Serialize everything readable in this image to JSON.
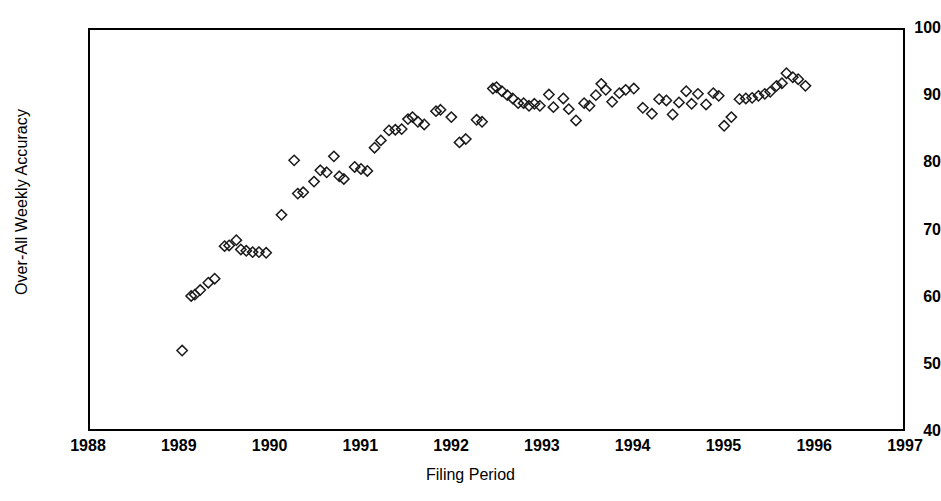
{
  "chart_data": {
    "type": "scatter",
    "title": "",
    "xlabel": "Filing Period",
    "ylabel": "Over-All Weekly Accuracy",
    "xlim": [
      1988,
      1997
    ],
    "ylim": [
      40,
      100
    ],
    "xticks": [
      1988,
      1989,
      1990,
      1991,
      1992,
      1993,
      1994,
      1995,
      1996,
      1997
    ],
    "yticks": [
      40,
      50,
      60,
      70,
      80,
      90,
      100
    ],
    "xtick_labels": [
      "1988",
      "1989",
      "1990",
      "1991",
      "1992",
      "1993",
      "1994",
      "1995",
      "1996",
      "1997"
    ],
    "ytick_labels": [
      "40",
      "50",
      "60",
      "70",
      "80",
      "90",
      "100"
    ],
    "grid": false,
    "legend": null,
    "marker": "open-diamond",
    "marker_color": "#1a1a1a",
    "series": [
      {
        "name": "Over-All Weekly Accuracy",
        "points": [
          [
            1989.02,
            51.8
          ],
          [
            1989.12,
            60.0
          ],
          [
            1989.16,
            60.2
          ],
          [
            1989.22,
            60.9
          ],
          [
            1989.31,
            62.0
          ],
          [
            1989.38,
            62.6
          ],
          [
            1989.49,
            67.5
          ],
          [
            1989.54,
            67.6
          ],
          [
            1989.62,
            68.4
          ],
          [
            1989.67,
            67.0
          ],
          [
            1989.73,
            66.8
          ],
          [
            1989.8,
            66.6
          ],
          [
            1989.87,
            66.6
          ],
          [
            1989.95,
            66.5
          ],
          [
            1990.12,
            72.2
          ],
          [
            1990.26,
            80.4
          ],
          [
            1990.3,
            75.4
          ],
          [
            1990.36,
            75.6
          ],
          [
            1990.48,
            77.2
          ],
          [
            1990.55,
            78.9
          ],
          [
            1990.62,
            78.6
          ],
          [
            1990.7,
            81.0
          ],
          [
            1990.76,
            78.0
          ],
          [
            1990.81,
            77.6
          ],
          [
            1990.93,
            79.4
          ],
          [
            1991.0,
            79.1
          ],
          [
            1991.07,
            78.8
          ],
          [
            1991.15,
            82.3
          ],
          [
            1991.22,
            83.4
          ],
          [
            1991.31,
            84.9
          ],
          [
            1991.38,
            85.0
          ],
          [
            1991.45,
            85.1
          ],
          [
            1991.52,
            86.6
          ],
          [
            1991.57,
            86.9
          ],
          [
            1991.63,
            86.2
          ],
          [
            1991.7,
            85.8
          ],
          [
            1991.83,
            87.8
          ],
          [
            1991.88,
            88.0
          ],
          [
            1992.0,
            86.9
          ],
          [
            1992.09,
            83.1
          ],
          [
            1992.16,
            83.6
          ],
          [
            1992.28,
            86.5
          ],
          [
            1992.34,
            86.2
          ],
          [
            1992.46,
            91.2
          ],
          [
            1992.5,
            91.4
          ],
          [
            1992.56,
            90.8
          ],
          [
            1992.62,
            90.2
          ],
          [
            1992.68,
            89.7
          ],
          [
            1992.74,
            89.0
          ],
          [
            1992.8,
            89.0
          ],
          [
            1992.86,
            88.6
          ],
          [
            1992.92,
            88.9
          ],
          [
            1992.98,
            88.6
          ],
          [
            1993.08,
            90.3
          ],
          [
            1993.13,
            88.4
          ],
          [
            1993.24,
            89.7
          ],
          [
            1993.3,
            88.1
          ],
          [
            1993.38,
            86.4
          ],
          [
            1993.47,
            89.0
          ],
          [
            1993.53,
            88.6
          ],
          [
            1993.6,
            90.2
          ],
          [
            1993.66,
            91.9
          ],
          [
            1993.71,
            91.0
          ],
          [
            1993.78,
            89.2
          ],
          [
            1993.86,
            90.5
          ],
          [
            1993.93,
            91.0
          ],
          [
            1994.02,
            91.2
          ],
          [
            1994.12,
            88.3
          ],
          [
            1994.22,
            87.4
          ],
          [
            1994.3,
            89.6
          ],
          [
            1994.38,
            89.4
          ],
          [
            1994.45,
            87.3
          ],
          [
            1994.52,
            89.1
          ],
          [
            1994.6,
            90.8
          ],
          [
            1994.66,
            88.9
          ],
          [
            1994.73,
            90.4
          ],
          [
            1994.82,
            88.8
          ],
          [
            1994.9,
            90.5
          ],
          [
            1994.96,
            90.1
          ],
          [
            1995.02,
            85.6
          ],
          [
            1995.1,
            86.9
          ],
          [
            1995.19,
            89.6
          ],
          [
            1995.26,
            89.7
          ],
          [
            1995.33,
            89.8
          ],
          [
            1995.4,
            90.1
          ],
          [
            1995.47,
            90.4
          ],
          [
            1995.53,
            90.7
          ],
          [
            1995.6,
            91.6
          ],
          [
            1995.66,
            92.0
          ],
          [
            1995.71,
            93.5
          ],
          [
            1995.78,
            92.9
          ],
          [
            1995.84,
            92.6
          ],
          [
            1995.92,
            91.6
          ]
        ]
      }
    ]
  }
}
